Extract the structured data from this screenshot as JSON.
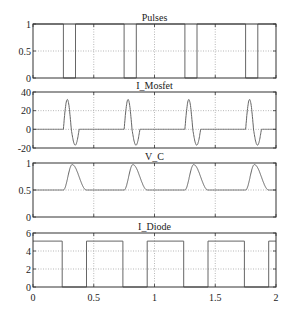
{
  "figure": {
    "width": 293,
    "height": 317,
    "line_color": "#666666",
    "frame_color": "#333333",
    "grid_color": "#999999"
  },
  "chart_data": [
    {
      "type": "line",
      "title": "Pulses",
      "xlabel": "",
      "ylabel": "",
      "xlim": [
        0,
        2
      ],
      "ylim": [
        0,
        1
      ],
      "yticks": [
        0,
        0.5,
        1
      ],
      "ytick_labels": [
        "0",
        "0.5",
        "1"
      ],
      "xticks": [
        0,
        0.5,
        1,
        1.5,
        2
      ],
      "grid": true,
      "x": [
        0,
        0.25,
        0.25,
        0.35,
        0.35,
        0.75,
        0.75,
        0.85,
        0.85,
        1.25,
        1.25,
        1.35,
        1.35,
        1.75,
        1.75,
        1.85,
        1.85,
        2
      ],
      "y": [
        1,
        1,
        0,
        0,
        1,
        1,
        0,
        0,
        1,
        1,
        0,
        0,
        1,
        1,
        0,
        0,
        1,
        1
      ]
    },
    {
      "type": "line",
      "title": "I_Mosfet",
      "xlabel": "",
      "ylabel": "",
      "xlim": [
        0,
        2
      ],
      "ylim": [
        -20,
        40
      ],
      "yticks": [
        -20,
        0,
        20,
        40
      ],
      "ytick_labels": [
        "-20",
        "0",
        "20",
        "40"
      ],
      "xticks": [
        0,
        0.5,
        1,
        1.5,
        2
      ],
      "grid": true,
      "waveform": "damped sine burst starting at each pulse off-edge",
      "burst_start": [
        0.25,
        0.75,
        1.25,
        1.75
      ],
      "peak_value": 32,
      "trough_value": -17,
      "burst_duration": 0.13
    },
    {
      "type": "line",
      "title": "V_C",
      "xlabel": "",
      "ylabel": "",
      "xlim": [
        0,
        2
      ],
      "ylim": [
        0,
        1
      ],
      "yticks": [
        0,
        0.5,
        1
      ],
      "ytick_labels": [
        "0",
        "0.5",
        "1"
      ],
      "xticks": [
        0,
        0.5,
        1,
        1.5,
        2
      ],
      "grid": true,
      "baseline": 0.5,
      "bump_start": [
        0.25,
        0.75,
        1.25,
        1.75
      ],
      "peak_value": 0.97,
      "bump_duration": 0.19
    },
    {
      "type": "line",
      "title": "I_Diode",
      "xlabel": "",
      "ylabel": "",
      "xlim": [
        0,
        2
      ],
      "ylim": [
        0,
        6
      ],
      "yticks": [
        0,
        2,
        4,
        6
      ],
      "ytick_labels": [
        "0",
        "2",
        "4",
        "6"
      ],
      "xticks": [
        0,
        0.5,
        1,
        1.5,
        2
      ],
      "xtick_labels": [
        "0",
        "0.5",
        "1",
        "1.5",
        "2"
      ],
      "grid": true,
      "x": [
        0,
        0.24,
        0.24,
        0.44,
        0.44,
        0.74,
        0.74,
        0.94,
        0.94,
        1.24,
        1.24,
        1.44,
        1.44,
        1.74,
        1.74,
        1.94,
        1.94,
        2
      ],
      "y": [
        5.1,
        5.1,
        0,
        0,
        5.1,
        5.1,
        0,
        0,
        5.1,
        5.1,
        0,
        0,
        5.1,
        5.1,
        0,
        0,
        5.1,
        5.1
      ]
    }
  ]
}
